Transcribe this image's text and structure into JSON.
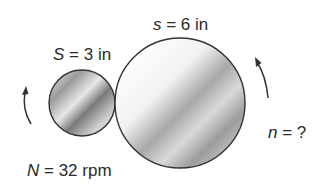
{
  "diagram": {
    "small_wheel": {
      "label_var": "S",
      "label_rest": " = 3 in",
      "speed_var": "N",
      "speed_rest": " = 32 rpm"
    },
    "large_wheel": {
      "label_var": "s",
      "label_rest": " = 6 in",
      "speed_var": "n",
      "speed_rest": " = ?"
    },
    "colors": {
      "stroke": "#333333",
      "shade_light": "#ffffff",
      "shade_dark": "#8c8c8c",
      "text": "#2a2a2a"
    }
  }
}
